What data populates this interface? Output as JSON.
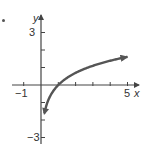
{
  "chart_data": {
    "type": "line",
    "title": "",
    "function": "y = ln(x)",
    "xlabel": "x",
    "ylabel": "y",
    "xlim": [
      -1,
      5
    ],
    "ylim": [
      -3,
      3
    ],
    "x_tick_labels": [
      "-1",
      "5"
    ],
    "y_tick_labels": [
      "3",
      "-3"
    ],
    "x_ticks": [
      -1,
      0,
      1,
      2,
      3,
      4,
      5
    ],
    "y_ticks": [
      -3,
      -2,
      -1,
      0,
      1,
      2,
      3
    ],
    "grid": false,
    "series": [
      {
        "name": "curve",
        "x": [
          0.2,
          0.3,
          0.5,
          0.75,
          1,
          1.5,
          2,
          2.5,
          3,
          3.5,
          4,
          4.5,
          5
        ],
        "y": [
          -1.61,
          -1.2,
          -0.69,
          -0.29,
          0,
          0.41,
          0.69,
          0.92,
          1.1,
          1.25,
          1.39,
          1.5,
          1.61
        ],
        "arrows": "both"
      }
    ],
    "color": "#555555"
  },
  "labels": {
    "x_axis": "x",
    "y_axis": "y",
    "x_min": "−1",
    "x_max": "5",
    "y_max": "3",
    "y_min": "−3"
  }
}
